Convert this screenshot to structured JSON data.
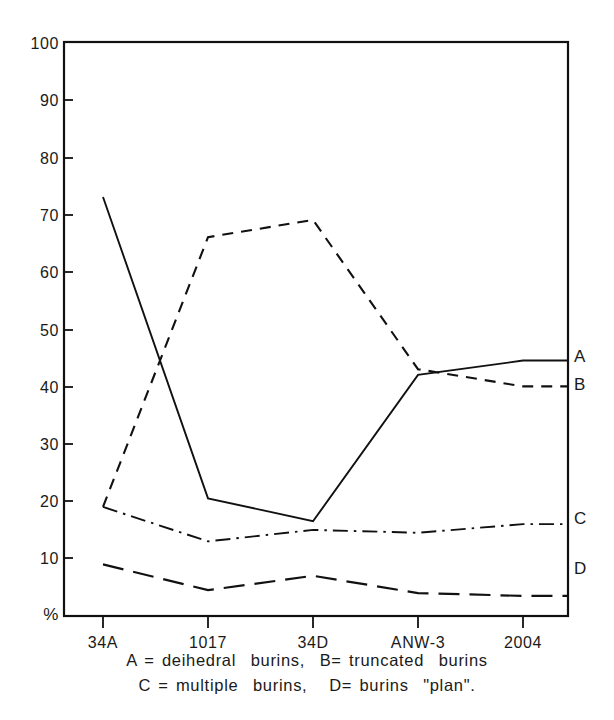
{
  "chart_data": {
    "type": "line",
    "title": "",
    "subtitle": "",
    "xlabel": "",
    "ylabel": "%",
    "categories": [
      "34A",
      "1017",
      "34D",
      "ANW-3",
      "2004"
    ],
    "ylim": [
      0,
      100
    ],
    "yticks": [
      0,
      10,
      20,
      30,
      40,
      50,
      60,
      70,
      80,
      90,
      100
    ],
    "ytick_labels": [
      "%",
      "10",
      "20",
      "30",
      "40",
      "50",
      "60",
      "70",
      "80",
      "90",
      "100"
    ],
    "grid": false,
    "legend_position": "right-inline",
    "series": [
      {
        "name": "A",
        "label": "A",
        "linestyle": "solid",
        "values": [
          73,
          20.5,
          16.5,
          42,
          44.5
        ]
      },
      {
        "name": "B",
        "label": "B",
        "linestyle": "dashed",
        "values": [
          19,
          66,
          69,
          43,
          40
        ]
      },
      {
        "name": "C",
        "label": "C",
        "linestyle": "dashdot",
        "values": [
          19,
          13,
          15,
          14.5,
          16
        ]
      },
      {
        "name": "D",
        "label": "D",
        "linestyle": "longdash",
        "values": [
          9,
          4.5,
          7,
          4,
          3.5
        ]
      }
    ],
    "annotations": [
      "A = deihedral burins, B= truncated burins",
      "C = multiple burins, D= burins \"plan\"."
    ]
  },
  "axis": {
    "y_label_100": "100",
    "y_label_90": "90",
    "y_label_80": "80",
    "y_label_70": "70",
    "y_label_60": "60",
    "y_label_50": "50",
    "y_label_40": "40",
    "y_label_30": "30",
    "y_label_20": "20",
    "y_label_10": "10",
    "y_label_0": "%",
    "x_label_0": "34A",
    "x_label_1": "1017",
    "x_label_2": "34D",
    "x_label_3": "ANW-3",
    "x_label_4": "2004"
  },
  "series_labels": {
    "a": "A",
    "b": "B",
    "c": "C",
    "d": "D"
  },
  "caption": {
    "line1": "A = deihedral  burins,  B= truncated  burins",
    "line2": "C = multiple  burins,   D= burins  \"plan\"."
  },
  "colors": {
    "ink": "#111111",
    "background": "#ffffff"
  }
}
